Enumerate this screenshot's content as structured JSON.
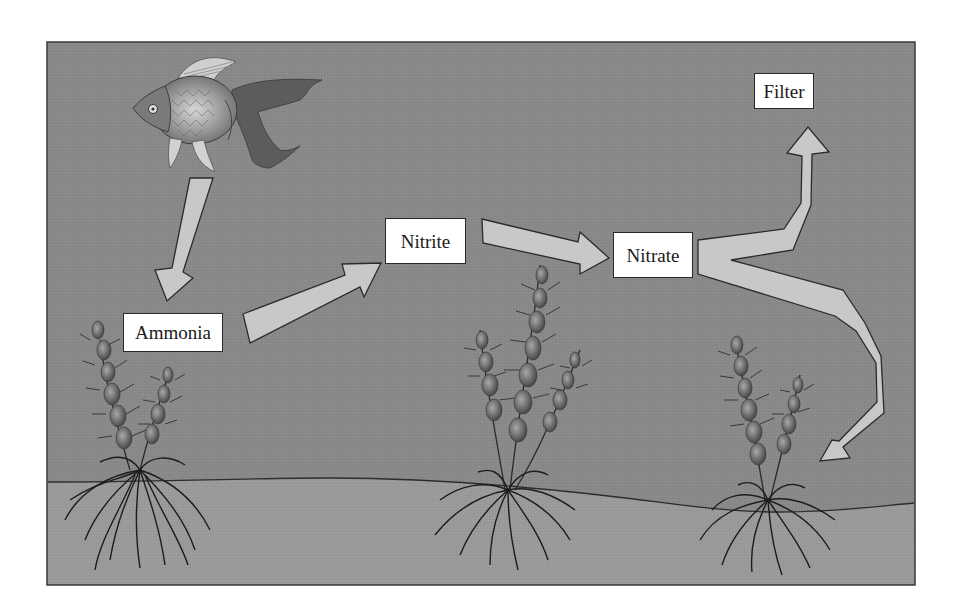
{
  "diagram": {
    "type": "nitrogen-cycle-aquarium",
    "colors": {
      "water": "#8a8a8a",
      "water_dark": "#7c7c7c",
      "sand": "#999999",
      "frame_border": "#3a3a3a",
      "arrow_fill": "#c9c9c9",
      "arrow_stroke": "#2b2b2b",
      "label_bg": "#ffffff"
    },
    "nodes": [
      {
        "id": "fish",
        "label": "",
        "kind": "image",
        "x": 133,
        "y": 52,
        "w": 195,
        "h": 122
      },
      {
        "id": "ammonia",
        "label": "Ammonia",
        "x": 123,
        "y": 313,
        "w": 100,
        "h": 39
      },
      {
        "id": "nitrite",
        "label": "Nitrite",
        "x": 385,
        "y": 218,
        "w": 81,
        "h": 46
      },
      {
        "id": "nitrate",
        "label": "Nitrate",
        "x": 613,
        "y": 232,
        "w": 80,
        "h": 46
      },
      {
        "id": "filter",
        "label": "Filter",
        "x": 754,
        "y": 73,
        "w": 60,
        "h": 36
      }
    ],
    "edges": [
      {
        "from": "fish",
        "to": "ammonia"
      },
      {
        "from": "ammonia",
        "to": "nitrite"
      },
      {
        "from": "nitrite",
        "to": "nitrate"
      },
      {
        "from": "nitrate",
        "to": "filter"
      },
      {
        "from": "nitrate",
        "to": "plants"
      }
    ],
    "plants": [
      {
        "id": "plant-left",
        "x": 140,
        "base_y": 505
      },
      {
        "id": "plant-middle",
        "x": 505,
        "base_y": 520
      },
      {
        "id": "plant-right",
        "x": 765,
        "base_y": 525
      }
    ]
  }
}
